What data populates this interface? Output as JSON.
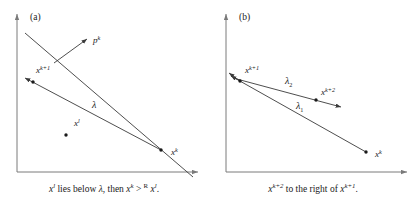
{
  "figure": {
    "background": "#ffffff",
    "stroke_color": "#3a3a3a",
    "axis_color": "#7a7a7a",
    "text_color": "#1a1a1a"
  },
  "panels": [
    {
      "tag": "(a)",
      "caption_parts": {
        "x_l_base": "x",
        "x_l_sup": "l",
        "mid": " lies below ",
        "lambda": "λ",
        "then": ", then ",
        "x_k_base": "x",
        "x_k_sup": "k",
        "rel": " > ",
        "rel_sup": "R",
        "x_l2_base": " x",
        "x_l2_sup": "l",
        "period": "."
      },
      "caption_text": "x l lies below λ, then x k > R x l.",
      "labels": [
        {
          "name": "vector-p-k",
          "base": "p",
          "sup": "k",
          "x": 93,
          "y": 43
        },
        {
          "name": "point-x-k-plus-1",
          "base": "x",
          "sup": "k+1",
          "x": 36,
          "y": 73
        },
        {
          "name": "line-lambda",
          "base": "λ",
          "sup": "",
          "x": 92,
          "y": 108
        },
        {
          "name": "point-x-l",
          "base": "x",
          "sup": "l",
          "x": 74,
          "y": 126
        },
        {
          "name": "point-x-k",
          "base": "x",
          "sup": "k",
          "x": 171,
          "y": 155
        }
      ]
    },
    {
      "tag": "(b)",
      "caption_parts": {
        "x_k2_base": "x",
        "x_k2_sup": "k+2",
        "mid": " to the right of ",
        "x_k1_base": "x",
        "x_k1_sup": "k+1",
        "period": "."
      },
      "caption_text": "x k+2 to the right of x k+1.",
      "labels": [
        {
          "name": "point-x-k-plus-1",
          "base": "x",
          "sup": "k+1",
          "x": 36,
          "y": 73
        },
        {
          "name": "line-lambda-2",
          "base": "λ",
          "sub": "2",
          "x": 76,
          "y": 84
        },
        {
          "name": "point-x-k-plus-2",
          "base": "x",
          "sup": "k+2",
          "x": 112,
          "y": 95
        },
        {
          "name": "line-lambda-1",
          "base": "λ",
          "sub": "1",
          "x": 87,
          "y": 109
        },
        {
          "name": "point-x-k",
          "base": "x",
          "sup": "k",
          "x": 166,
          "y": 157
        }
      ]
    }
  ]
}
